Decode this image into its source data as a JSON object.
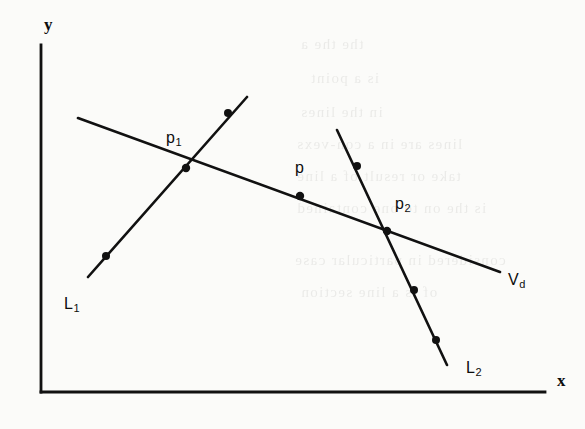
{
  "figure": {
    "kind": "line-intersection-diagram",
    "width": 585,
    "height": 429,
    "background_color": "#fbfbf9",
    "ink_color": "#111111"
  },
  "axes": {
    "y_label": "y",
    "x_label": "x",
    "origin": {
      "x": 41,
      "y": 392
    },
    "y_top": {
      "x": 41,
      "y": 45
    },
    "x_right": {
      "x": 545,
      "y": 392
    },
    "y_label_pos": {
      "x": 44,
      "y": 16
    },
    "x_label_pos": {
      "x": 557,
      "y": 372
    }
  },
  "lines": [
    {
      "id": "vd",
      "label": "V",
      "label_sub": "d",
      "label_pos": {
        "x": 508,
        "y": 272
      },
      "from": {
        "x": 78,
        "y": 118
      },
      "to": {
        "x": 500,
        "y": 272
      },
      "stroke_width": 2.6
    },
    {
      "id": "l1",
      "label": "L",
      "label_sub": "1",
      "label_pos": {
        "x": 64,
        "y": 296
      },
      "from": {
        "x": 88,
        "y": 277
      },
      "to": {
        "x": 247,
        "y": 97
      },
      "stroke_width": 2.6
    },
    {
      "id": "l2",
      "label": "L",
      "label_sub": "2",
      "label_pos": {
        "x": 466,
        "y": 360
      },
      "from": {
        "x": 337,
        "y": 130
      },
      "to": {
        "x": 447,
        "y": 365
      },
      "stroke_width": 2.6
    }
  ],
  "points": [
    {
      "id": "p1",
      "label": "p",
      "label_sub": "1",
      "x": 186,
      "y": 168,
      "label_pos": {
        "x": 166,
        "y": 130
      },
      "marker": "dot",
      "on": [
        "l1",
        "vd"
      ]
    },
    {
      "id": "p",
      "label": "p",
      "label_sub": "",
      "x": 300,
      "y": 196,
      "label_pos": {
        "x": 295,
        "y": 160
      },
      "marker": "dot",
      "on": [
        "vd"
      ]
    },
    {
      "id": "p2",
      "label": "p",
      "label_sub": "2",
      "x": 387,
      "y": 231,
      "label_pos": {
        "x": 395,
        "y": 196
      },
      "marker": "dot",
      "on": [
        "l2",
        "vd"
      ]
    }
  ],
  "markers": [
    {
      "id": "l1-m1",
      "x": 106,
      "y": 256,
      "on": "l1"
    },
    {
      "id": "l1-m2",
      "x": 228,
      "y": 113,
      "on": "l1"
    },
    {
      "id": "l2-m1",
      "x": 357,
      "y": 166,
      "on": "l2"
    },
    {
      "id": "l2-m2",
      "x": 414,
      "y": 290,
      "on": "l2"
    },
    {
      "id": "l2-m3",
      "x": 436,
      "y": 340,
      "on": "l2"
    }
  ],
  "ghost_text": [
    {
      "text": "the the a",
      "x": 300,
      "y": 36
    },
    {
      "text": "is a point",
      "x": 310,
      "y": 70
    },
    {
      "text": "in the lines",
      "x": 300,
      "y": 104
    },
    {
      "text": "lines are in a con-vexs",
      "x": 296,
      "y": 136
    },
    {
      "text": "take or result of a line",
      "x": 296,
      "y": 168
    },
    {
      "text": "is the on to one contained",
      "x": 296,
      "y": 200
    },
    {
      "text": "considered in particular case",
      "x": 294,
      "y": 252
    },
    {
      "text": "of is a line section",
      "x": 300,
      "y": 284
    }
  ]
}
